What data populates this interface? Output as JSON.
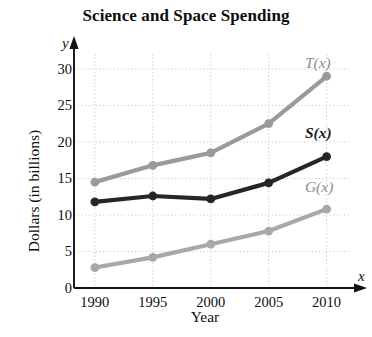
{
  "chart_data": {
    "type": "line",
    "title": "Science and Space Spending",
    "xlabel": "Year",
    "ylabel": "Dollars (in billions)",
    "x_axis_symbol": "x",
    "y_axis_symbol": "y",
    "x": [
      1990,
      1995,
      2000,
      2005,
      2010
    ],
    "categories": [
      "1990",
      "1995",
      "2000",
      "2005",
      "2010"
    ],
    "xlim": [
      1988.2,
      2011.5
    ],
    "ylim": [
      0,
      31.5
    ],
    "xticks": [
      "1990",
      "1995",
      "2000",
      "2005",
      "2010"
    ],
    "yticks": [
      "0",
      "5",
      "10",
      "15",
      "20",
      "25",
      "30"
    ],
    "ytick_values": [
      0,
      5,
      10,
      15,
      20,
      25,
      30
    ],
    "grid": true,
    "grid_style": "dotted",
    "grid_color": "#c9c9c9",
    "legend_position": "right-inline-end-of-line",
    "series": [
      {
        "name": "T(x)",
        "label": "T(x)",
        "color": "#9a9a9a",
        "values": [
          14.5,
          16.8,
          18.5,
          22.5,
          29.0
        ],
        "label_x": 2010.2,
        "label_y": 31.0
      },
      {
        "name": "S(x)",
        "label": "S(x)",
        "color": "#262626",
        "values": [
          11.8,
          12.6,
          12.2,
          14.4,
          18.0
        ],
        "label_x": 2010.2,
        "label_y": 21.3
      },
      {
        "name": "G(x)",
        "label": "G(x)",
        "color": "#a8a8a8",
        "values": [
          2.8,
          4.2,
          6.0,
          7.8,
          10.8
        ],
        "label_x": 2010.2,
        "label_y": 14.0
      }
    ]
  }
}
